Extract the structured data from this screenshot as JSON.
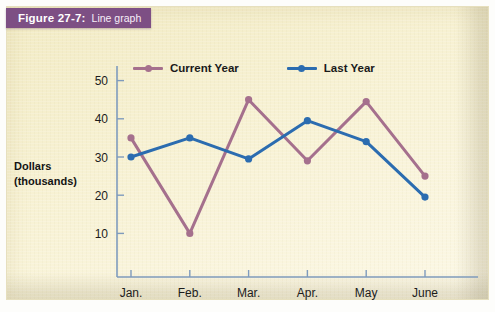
{
  "banner": {
    "figure_label": "Figure 27-7:",
    "caption": "Line graph",
    "color": "#7d4f84"
  },
  "axis_title": {
    "line1": "Dollars",
    "line2": "(thousands)"
  },
  "legend": {
    "entries": [
      {
        "label": "Current Year",
        "color": "#a5708d",
        "marker_icon": "line-marker-icon"
      },
      {
        "label": "Last Year",
        "color": "#2b6cb0",
        "marker_icon": "line-marker-icon"
      }
    ]
  },
  "chart_data": {
    "type": "line",
    "title": "Line graph",
    "xlabel": "",
    "ylabel": "Dollars (thousands)",
    "categories": [
      "Jan.",
      "Feb.",
      "Mar.",
      "Apr.",
      "May",
      "June"
    ],
    "ylim": [
      0,
      55
    ],
    "yticks": [
      10,
      20,
      30,
      40,
      50
    ],
    "ytick_labels": [
      "10",
      "20",
      "30",
      "40",
      "50"
    ],
    "grid": false,
    "legend_position": "top",
    "series": [
      {
        "name": "Current Year",
        "color": "#a5708d",
        "values": [
          35,
          10,
          45,
          29,
          44.5,
          25
        ]
      },
      {
        "name": "Last Year",
        "color": "#2b6cb0",
        "values": [
          30,
          35,
          29.5,
          39.5,
          34,
          19.5
        ]
      }
    ]
  },
  "colors": {
    "background": "#f5eec8",
    "axis": "#7f9bbd",
    "current_year": "#a5708d",
    "last_year": "#2b6cb0",
    "banner": "#7d4f84"
  }
}
